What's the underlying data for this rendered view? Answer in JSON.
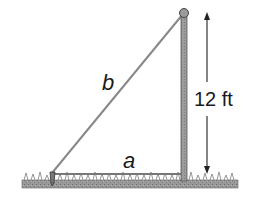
{
  "diagram": {
    "type": "right-triangle-flagpole",
    "labels": {
      "hypotenuse": "b",
      "base": "a",
      "height": "12 ft"
    },
    "elements": {
      "pole": "vertical-pole",
      "ball": "pole-top-ball",
      "wire": "guy-wire",
      "stake": "ground-stake",
      "ground": "grass-ground"
    },
    "colors": {
      "line": "#777777",
      "pole": "#8a8a8a",
      "ground": "#8c8c8c",
      "text": "#1a1a1a"
    }
  }
}
